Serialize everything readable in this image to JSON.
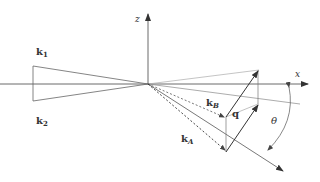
{
  "diagram": {
    "axes": {
      "x_label": "x",
      "z_label": "z"
    },
    "beams": {
      "k1_label": "k",
      "k1_sub": "1",
      "k2_label": "k",
      "k2_sub": "2"
    },
    "vectors": {
      "kA_label": "k",
      "kA_sub": "A",
      "kB_label": "k",
      "kB_sub": "B",
      "q_label": "q"
    },
    "angle": {
      "label": "θ"
    },
    "colors": {
      "dark": "#333333",
      "mid": "#666666",
      "light": "#aaaaaa"
    }
  }
}
